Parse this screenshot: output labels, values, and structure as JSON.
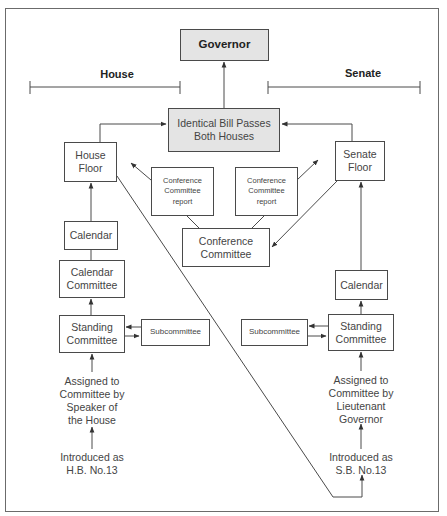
{
  "diagram": {
    "colors": {
      "line": "#4a4a4a",
      "highlight_fill": "#e4e4e4",
      "box_fill": "#ffffff"
    },
    "chambers": {
      "house": "House",
      "senate": "Senate"
    },
    "nodes": {
      "governor": "Governor",
      "identical_bill": "Identical Bill Passes\nBoth Houses",
      "house_floor": "House\nFloor",
      "senate_floor": "Senate\nFloor",
      "conf_report_left": "Conference\nCommittee\nreport",
      "conf_report_right": "Conference\nCommittee\nreport",
      "conference_committee": "Conference\nCommittee",
      "house_calendar": "Calendar",
      "house_calendar_committee": "Calendar\nCommittee",
      "house_standing_committee": "Standing\nCommittee",
      "house_subcommittee": "Subcommittee",
      "house_assigned": "Assigned to\nCommittee by\nSpeaker of\nthe House",
      "house_introduced": "Introduced as\nH.B. No.13",
      "senate_calendar": "Calendar",
      "senate_standing_committee": "Standing\nCommittee",
      "senate_subcommittee": "Subcommittee",
      "senate_assigned": "Assigned to\nCommittee by\nLieutenant\nGovernor",
      "senate_introduced": "Introduced as\nS.B. No.13"
    },
    "edges": [
      {
        "from": "house_introduced",
        "to": "house_assigned"
      },
      {
        "from": "house_assigned",
        "to": "house_standing_committee"
      },
      {
        "from": "house_standing_committee",
        "to": "house_subcommittee"
      },
      {
        "from": "house_subcommittee",
        "to": "house_standing_committee"
      },
      {
        "from": "house_standing_committee",
        "to": "house_calendar_committee"
      },
      {
        "from": "house_calendar_committee",
        "to": "house_calendar"
      },
      {
        "from": "house_calendar",
        "to": "house_floor"
      },
      {
        "from": "house_floor",
        "to": "identical_bill"
      },
      {
        "from": "house_floor",
        "to": "senate_introduced"
      },
      {
        "from": "senate_introduced",
        "to": "senate_assigned"
      },
      {
        "from": "senate_assigned",
        "to": "senate_standing_committee"
      },
      {
        "from": "senate_standing_committee",
        "to": "senate_subcommittee"
      },
      {
        "from": "senate_subcommittee",
        "to": "senate_standing_committee"
      },
      {
        "from": "senate_standing_committee",
        "to": "senate_calendar"
      },
      {
        "from": "senate_calendar",
        "to": "senate_floor"
      },
      {
        "from": "senate_floor",
        "to": "identical_bill"
      },
      {
        "from": "senate_floor",
        "to": "conference_committee"
      },
      {
        "from": "conference_committee",
        "to": "conf_report_left"
      },
      {
        "from": "conference_committee",
        "to": "conf_report_right"
      },
      {
        "from": "conf_report_left",
        "to": "house_floor"
      },
      {
        "from": "conf_report_right",
        "to": "senate_floor"
      },
      {
        "from": "identical_bill",
        "to": "governor"
      }
    ]
  }
}
